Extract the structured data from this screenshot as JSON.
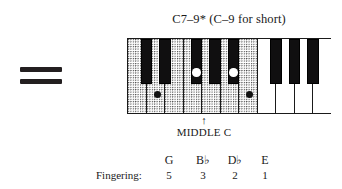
{
  "equals": {
    "name": "equals-sign",
    "bars": 2
  },
  "chord": {
    "title": "C7–9* (C–9 for short)"
  },
  "keyboard": {
    "white_keys": [
      {
        "id": "w1",
        "shaded": true,
        "left": 0,
        "width": 18.5
      },
      {
        "id": "w2",
        "shaded": true,
        "left": 18.5,
        "width": 18.5
      },
      {
        "id": "w3",
        "shaded": true,
        "left": 37.0,
        "width": 18.5
      },
      {
        "id": "w4",
        "shaded": true,
        "left": 55.5,
        "width": 18.5
      },
      {
        "id": "w5",
        "shaded": true,
        "left": 74.0,
        "width": 18.5
      },
      {
        "id": "w6",
        "shaded": true,
        "left": 92.5,
        "width": 18.5
      },
      {
        "id": "w7",
        "shaded": true,
        "left": 111.0,
        "width": 18.5
      },
      {
        "id": "w8",
        "shaded": false,
        "left": 129.5,
        "width": 18.5
      },
      {
        "id": "w9",
        "shaded": false,
        "left": 148.0,
        "width": 18.5
      },
      {
        "id": "w10",
        "shaded": false,
        "left": 166.5,
        "width": 18.5
      },
      {
        "id": "w11",
        "shaded": false,
        "left": 185.0,
        "width": 19.0
      }
    ],
    "black_keys": [
      {
        "id": "b1",
        "left": 12.5,
        "width": 11.5
      },
      {
        "id": "b2",
        "left": 31.0,
        "width": 11.5
      },
      {
        "id": "b3",
        "left": 62.5,
        "width": 11.5
      },
      {
        "id": "b4",
        "left": 81.0,
        "width": 11.5
      },
      {
        "id": "b5",
        "left": 99.5,
        "width": 11.5
      },
      {
        "id": "b6",
        "left": 142.0,
        "width": 11.5
      },
      {
        "id": "b7",
        "left": 160.5,
        "width": 11.5
      },
      {
        "id": "b8",
        "left": 179.0,
        "width": 11.5
      }
    ],
    "markers": [
      {
        "id": "m-g",
        "note": "G",
        "type": "white",
        "left": 25.5
      },
      {
        "id": "m-bb",
        "note": "B♭",
        "type": "black",
        "left": 64.0
      },
      {
        "id": "m-db",
        "note": "D♭",
        "type": "black",
        "left": 101.0
      },
      {
        "id": "m-e",
        "note": "E",
        "type": "white",
        "left": 118.0
      }
    ]
  },
  "middle_c": {
    "arrow": "↑",
    "label": "MIDDLE C"
  },
  "fingering": {
    "label": "Fingering:",
    "columns": [
      {
        "note": "G",
        "flat": "",
        "number": "5",
        "left": 62
      },
      {
        "note": "B",
        "flat": "♭",
        "number": "3",
        "left": 96
      },
      {
        "note": "D",
        "flat": "♭",
        "number": "2",
        "left": 128
      },
      {
        "note": "E",
        "flat": "",
        "number": "1",
        "left": 158
      }
    ]
  },
  "colors": {
    "ink": "#1a1a1a",
    "black_key": "#100f10",
    "white_key": "#ffffff",
    "marker_white": "#ffffff",
    "marker_black": "#121212"
  }
}
